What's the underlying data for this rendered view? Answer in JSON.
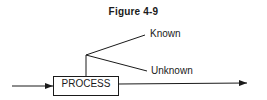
{
  "figure": {
    "title": "Figure 4-9",
    "process_label": "PROCESS",
    "branches": [
      {
        "label": "Known"
      },
      {
        "label": "Unknown"
      }
    ]
  }
}
